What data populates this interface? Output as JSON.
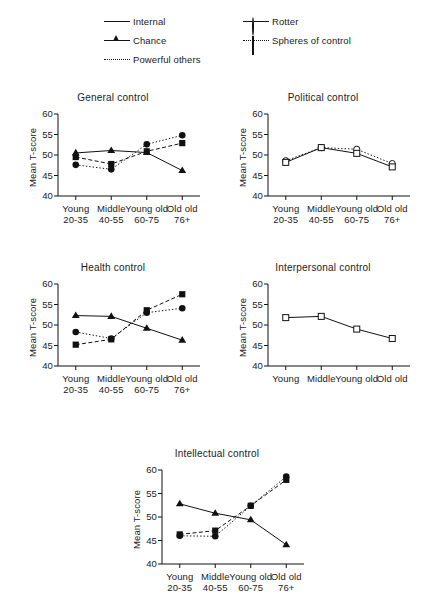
{
  "figure": {
    "y_axis_label": "Mean T-score",
    "y_ticks": [
      "60",
      "55",
      "50",
      "45",
      "40"
    ],
    "categories": [
      {
        "line1": "Young",
        "line2": "20-35"
      },
      {
        "line1": "Middle",
        "line2": "40-55"
      },
      {
        "line1": "Young old",
        "line2": "60-75"
      },
      {
        "line1": "Old old",
        "line2": "76+"
      }
    ]
  },
  "legend": {
    "left": [
      {
        "label": "Internal",
        "marker": "filled-triangle",
        "line": "solid"
      },
      {
        "label": "Chance",
        "marker": "filled-circle",
        "line": "solid"
      },
      {
        "label": "Powerful others",
        "marker": "filled-square",
        "line": "dotted"
      }
    ],
    "right": [
      {
        "label": "Rotter",
        "marker": "open-circle",
        "line": "solid"
      },
      {
        "label": "Spheres of control",
        "marker": "open-square",
        "line": "dotted"
      }
    ]
  },
  "chart_data": [
    {
      "type": "line",
      "title": "General control",
      "xlabel": "",
      "ylabel": "Mean T-score",
      "ylim": [
        40,
        60
      ],
      "yticks": [
        40,
        45,
        50,
        55,
        60
      ],
      "grid": false,
      "legend_position": "top-shared",
      "categories": [
        "Young 20-35",
        "Middle 40-55",
        "Young old 60-75",
        "Old old 76+"
      ],
      "series": [
        {
          "name": "Internal",
          "marker": "filled-triangle",
          "line": "solid",
          "values": [
            50.5,
            51.1,
            50.6,
            46.2
          ]
        },
        {
          "name": "Chance",
          "marker": "filled-circle",
          "line": "dotted",
          "values": [
            47.6,
            46.5,
            52.6,
            54.8
          ]
        },
        {
          "name": "Powerful others",
          "marker": "filled-square",
          "line": "dashed",
          "values": [
            49.5,
            47.8,
            50.9,
            52.9
          ]
        }
      ]
    },
    {
      "type": "line",
      "title": "Political control",
      "xlabel": "",
      "ylabel": "Mean T-score",
      "ylim": [
        40,
        60
      ],
      "yticks": [
        40,
        45,
        50,
        55,
        60
      ],
      "grid": false,
      "legend_position": "top-shared",
      "categories": [
        "Young 20-35",
        "Middle 40-55",
        "Young old 60-75",
        "Old old 76+"
      ],
      "series": [
        {
          "name": "Rotter",
          "marker": "open-circle",
          "line": "dotted",
          "values": [
            48.6,
            51.8,
            51.4,
            47.9
          ]
        },
        {
          "name": "Spheres of control",
          "marker": "open-square",
          "line": "solid",
          "values": [
            48.2,
            51.8,
            50.4,
            47.1
          ]
        }
      ]
    },
    {
      "type": "line",
      "title": "Health control",
      "xlabel": "",
      "ylabel": "Mean T-score",
      "ylim": [
        40,
        60
      ],
      "yticks": [
        40,
        45,
        50,
        55,
        60
      ],
      "grid": false,
      "legend_position": "top-shared",
      "categories": [
        "Young 20-35",
        "Middle 40-55",
        "Young old 60-75",
        "Old old 76+"
      ],
      "series": [
        {
          "name": "Internal",
          "marker": "filled-triangle",
          "line": "solid",
          "values": [
            52.3,
            52.1,
            49.2,
            46.3
          ]
        },
        {
          "name": "Chance",
          "marker": "filled-circle",
          "line": "dotted",
          "values": [
            48.3,
            46.7,
            53.0,
            54.1
          ]
        },
        {
          "name": "Powerful others",
          "marker": "filled-square",
          "line": "dashed",
          "values": [
            45.2,
            46.5,
            53.6,
            57.5
          ]
        }
      ]
    },
    {
      "type": "line",
      "title": "Interpersonal control",
      "xlabel": "",
      "ylabel": "Mean T-score",
      "ylim": [
        40,
        60
      ],
      "yticks": [
        40,
        45,
        50,
        55,
        60
      ],
      "grid": false,
      "legend_position": "top-shared",
      "categories": [
        "Young 20-35",
        "Middle 40-55",
        "Young old 60-75",
        "Old old 76+"
      ],
      "series": [
        {
          "name": "Spheres of control",
          "marker": "open-square",
          "line": "solid",
          "values": [
            51.8,
            52.1,
            49.0,
            46.7
          ]
        }
      ]
    },
    {
      "type": "line",
      "title": "Intellectual control",
      "xlabel": "",
      "ylabel": "Mean T-score",
      "ylim": [
        40,
        60
      ],
      "yticks": [
        40,
        45,
        50,
        55,
        60
      ],
      "grid": false,
      "legend_position": "top-shared",
      "categories": [
        "Young 20-35",
        "Middle 40-55",
        "Young old 60-75",
        "Old old 76+"
      ],
      "series": [
        {
          "name": "Internal",
          "marker": "filled-triangle",
          "line": "solid",
          "values": [
            52.8,
            50.8,
            49.4,
            44.1
          ]
        },
        {
          "name": "Chance",
          "marker": "filled-circle",
          "line": "dotted",
          "values": [
            46.0,
            45.9,
            52.4,
            58.6
          ]
        },
        {
          "name": "Powerful others",
          "marker": "filled-square",
          "line": "dashed",
          "values": [
            46.3,
            47.1,
            52.4,
            57.9
          ]
        }
      ]
    }
  ]
}
